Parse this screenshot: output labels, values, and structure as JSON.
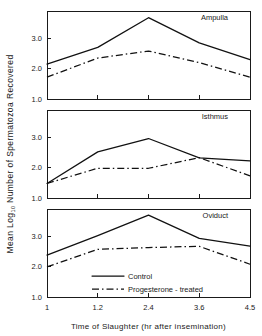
{
  "chart_data": {
    "type": "line",
    "title": "",
    "xlabel": "Time  of  Slaughter  (hr after insemination)",
    "ylabel": "Mean  Log10  Number  of  Spermatozoa  Recovered",
    "ylabel_parts": {
      "pre": "Mean  Log",
      "sub": "10",
      "post": "  Number  of  Spermatozoa  Recovered"
    },
    "x": [
      "1",
      "1.2",
      "2.4",
      "3.6",
      "4.5"
    ],
    "xtick_labels": [
      "1",
      "1.2",
      "2.4",
      "3.6",
      "4.5"
    ],
    "ytick_labels": [
      "1.0",
      "2.0",
      "3.0"
    ],
    "ytick_values": [
      1.0,
      2.0,
      3.0
    ],
    "ylim": [
      1.0,
      3.9
    ],
    "grid": false,
    "legend_position": "bottom-center",
    "legend": [
      {
        "name": "Control",
        "style": "solid"
      },
      {
        "name": "Progesterone - treated",
        "style": "dash-dot"
      }
    ],
    "panels": [
      {
        "id": "ampulla",
        "title": "Ampulla",
        "series": [
          {
            "name": "Control",
            "style": "solid",
            "values": [
              2.15,
              2.7,
              3.68,
              2.85,
              2.3
            ]
          },
          {
            "name": "Progesterone - treated",
            "style": "dash-dot",
            "values": [
              1.72,
              2.35,
              2.58,
              2.2,
              1.72
            ]
          }
        ]
      },
      {
        "id": "isthmus",
        "title": "Isthmus",
        "series": [
          {
            "name": "Control",
            "style": "solid",
            "values": [
              1.48,
              2.52,
              2.96,
              2.32,
              2.22
            ]
          },
          {
            "name": "Progesterone - treated",
            "style": "dash-dot",
            "values": [
              1.48,
              1.98,
              1.98,
              2.33,
              1.73
            ]
          }
        ]
      },
      {
        "id": "oviduct",
        "title": "Oviduct",
        "series": [
          {
            "name": "Control",
            "style": "solid",
            "values": [
              2.38,
              3.02,
              3.7,
              2.93,
              2.68
            ]
          },
          {
            "name": "Progesterone - treated",
            "style": "dash-dot",
            "values": [
              1.99,
              2.57,
              2.63,
              2.67,
              2.08
            ]
          }
        ]
      }
    ]
  }
}
